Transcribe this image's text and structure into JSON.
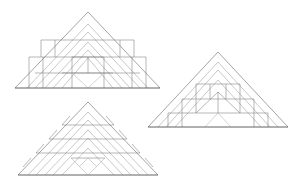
{
  "page": {
    "background_color": "#ffffff",
    "width": 300,
    "height": 185
  },
  "palette": {
    "outline": "#58585a",
    "inner_chevron": "#9a9a9c",
    "tile": "#6e6e70",
    "tile_light": "#a8a8aa",
    "background": "#ffffff"
  },
  "figures": [
    {
      "id": "figure-top-left",
      "label": "Triangle A",
      "apex": [
        88,
        12
      ],
      "left": [
        15,
        88
      ],
      "right": [
        160,
        88
      ],
      "chevron_count": 3,
      "tiling": "squares",
      "description": "Isosceles triangle with three nested chevron bands and a square-tiled core"
    },
    {
      "id": "figure-bottom-left",
      "label": "Triangle B",
      "apex": [
        88,
        102
      ],
      "left": [
        18,
        175
      ],
      "right": [
        158,
        175
      ],
      "chevron_count": 3,
      "tiling": "rhombi",
      "description": "Isosceles triangle with nested chevrons and rhombus strips along the slopes"
    },
    {
      "id": "figure-right",
      "label": "Triangle C",
      "apex": [
        218,
        52
      ],
      "left": [
        148,
        127
      ],
      "right": [
        288,
        127
      ],
      "chevron_count": 2,
      "tiling": "squares",
      "description": "Isosceles triangle with two nested chevron bands and a dense square-tiled interior"
    }
  ]
}
